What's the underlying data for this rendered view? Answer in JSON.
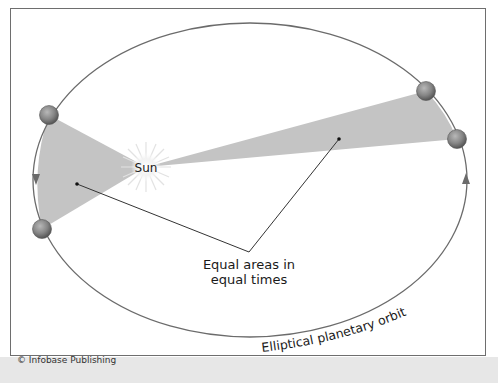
{
  "figure": {
    "sun_label": "Sun",
    "area_label_line1": "Equal areas in",
    "area_label_line2": "equal times",
    "orbit_label": "Elliptical planetary orbit",
    "credit": "© Infobase Publishing"
  },
  "colors": {
    "orbit": "#6b6b6b",
    "swept_area": "#c4c4c4",
    "planet": "#8a8a8a",
    "frame": "#6e6e6e",
    "bottom_band": "#e7e7e7"
  },
  "elements": {
    "planets": [
      "planet-left-top",
      "planet-left-bottom",
      "planet-right-top",
      "planet-right-bottom"
    ],
    "arrows": [
      "orbit-direction-left (down)",
      "orbit-direction-right (up)"
    ]
  }
}
